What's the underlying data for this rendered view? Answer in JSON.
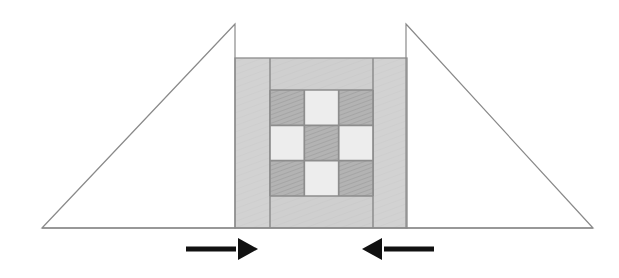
{
  "figure": {
    "title": "Compression test schematic: wedge anvils loading a layered checkerboard specimen",
    "width": 619,
    "height": 278,
    "background_color": "#ffffff",
    "caption": ""
  },
  "colors": {
    "background": "#ffffff",
    "outline_stroke": "#8a8a8a",
    "block_light_grey": "#d2d2d2",
    "block_mid_grey": "#cfcfcf",
    "cell_dark_grey": "#b3b3b3",
    "cell_light_grey": "#ededed",
    "grid_line": "#8d8d8d",
    "arrow_black": "#111111",
    "hatch_line": "#9d9d9d"
  },
  "left_wedge": {
    "name": "left-wedge",
    "label": "",
    "apex": {
      "x": 235,
      "y": 24
    },
    "base_left": {
      "x": 42,
      "y": 228
    },
    "base_right": {
      "x": 235,
      "y": 228
    },
    "fill": "none",
    "stroke": "#8a8a8a",
    "stroke_width": 1.2
  },
  "right_wedge": {
    "name": "right-wedge",
    "label": "",
    "apex": {
      "x": 406,
      "y": 24
    },
    "base_left": {
      "x": 406,
      "y": 228
    },
    "base_right": {
      "x": 593,
      "y": 228
    },
    "fill": "none",
    "stroke": "#8a8a8a",
    "stroke_width": 1.2
  },
  "specimen_block": {
    "name": "specimen-block",
    "label": "",
    "x": 235,
    "y": 58,
    "width": 172,
    "height": 170,
    "fill": "#d2d2d2",
    "stroke": "#8d8d8d",
    "stroke_width": 1.2,
    "left_column": {
      "name": "left-side-column",
      "x": 235,
      "y": 58,
      "width": 35,
      "height": 170,
      "fill": "#d2d2d2"
    },
    "center_column": {
      "name": "center-column",
      "x": 270,
      "y": 58,
      "width": 103,
      "height": 170,
      "fill": "#cfcfcf"
    },
    "right_column": {
      "name": "right-side-column",
      "x": 373,
      "y": 58,
      "width": 34,
      "height": 170,
      "fill": "#d2d2d2"
    }
  },
  "checkerboard": {
    "name": "checkerboard-grid",
    "label": "",
    "x": 270,
    "y": 90,
    "width": 103,
    "height": 106,
    "rows": 3,
    "cols": 3,
    "cell_width": 34.3,
    "cell_height": 35.3,
    "grid_line_color": "#8d8d8d",
    "grid_line_width": 1.6,
    "pattern": [
      [
        "dark",
        "light",
        "dark"
      ],
      [
        "light",
        "dark",
        "light"
      ],
      [
        "dark",
        "light",
        "dark"
      ]
    ],
    "cells": [
      {
        "row": 0,
        "col": 0,
        "tone": "dark",
        "fill": "#b3b3b3",
        "hatched": true
      },
      {
        "row": 0,
        "col": 1,
        "tone": "light",
        "fill": "#ededed",
        "hatched": false
      },
      {
        "row": 0,
        "col": 2,
        "tone": "dark",
        "fill": "#b3b3b3",
        "hatched": true
      },
      {
        "row": 1,
        "col": 0,
        "tone": "light",
        "fill": "#ededed",
        "hatched": false
      },
      {
        "row": 1,
        "col": 1,
        "tone": "dark",
        "fill": "#b3b3b3",
        "hatched": true
      },
      {
        "row": 1,
        "col": 2,
        "tone": "light",
        "fill": "#ededed",
        "hatched": false
      },
      {
        "row": 2,
        "col": 0,
        "tone": "dark",
        "fill": "#b3b3b3",
        "hatched": true
      },
      {
        "row": 2,
        "col": 1,
        "tone": "light",
        "fill": "#ededed",
        "hatched": false
      },
      {
        "row": 2,
        "col": 2,
        "tone": "dark",
        "fill": "#b3b3b3",
        "hatched": true
      }
    ]
  },
  "arrows": [
    {
      "name": "left-load-arrow",
      "direction": "right",
      "label": "",
      "tail_x": 186,
      "tip_x": 258,
      "y": 249,
      "shaft_thickness": 5,
      "head_length": 20,
      "head_half_width": 11,
      "color": "#111111"
    },
    {
      "name": "right-load-arrow",
      "direction": "left",
      "label": "",
      "tail_x": 434,
      "tip_x": 362,
      "y": 249,
      "shaft_thickness": 5,
      "head_length": 20,
      "head_half_width": 11,
      "color": "#111111"
    }
  ],
  "chart_data": {
    "type": "diagram",
    "xlabel": "",
    "ylabel": "",
    "annotations": [
      "left wedge anvil",
      "right wedge anvil",
      "layered specimen block",
      "3x3 checkerboard core",
      "inward compressive load arrows"
    ]
  }
}
